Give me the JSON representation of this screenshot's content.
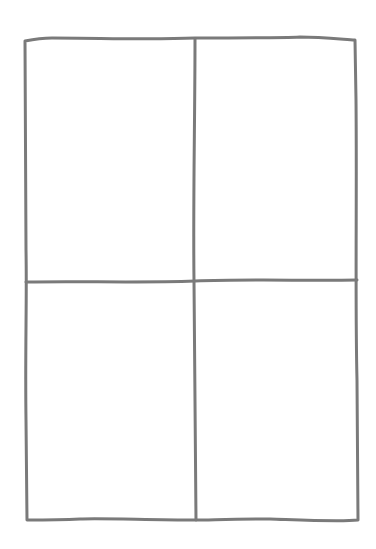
{
  "diagram": {
    "type": "grid",
    "rows": 2,
    "columns": 2,
    "stroke_color": "#7a7a7a",
    "background": "#ffffff",
    "cells": [
      "top-left",
      "top-right",
      "bottom-left",
      "bottom-right"
    ]
  }
}
